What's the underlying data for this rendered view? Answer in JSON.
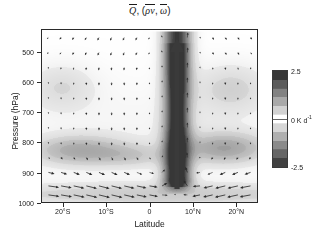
{
  "figure": {
    "title_parts": {
      "q": "Q",
      "comma": ", (",
      "rho_v": "ρv",
      "sep": ", ",
      "omega": "ω",
      "close": ")"
    },
    "title_plain": "Q̅, (ρv̅, ω̅)"
  },
  "axes": {
    "x": {
      "label": "Latitude",
      "ticks": [
        "20°S",
        "10°S",
        "0",
        "10°N",
        "20°N"
      ],
      "tick_values": [
        -20,
        -10,
        0,
        10,
        20
      ],
      "range": [
        -25,
        25
      ]
    },
    "y": {
      "label": "Pressure (hPa)",
      "ticks": [
        "500",
        "600",
        "700",
        "800",
        "900",
        "1000"
      ],
      "tick_values": [
        500,
        600,
        700,
        800,
        900,
        1000
      ],
      "range": [
        1000,
        425
      ],
      "inverted": true
    }
  },
  "colorbar": {
    "max_label": "2.5",
    "mid_label": "0",
    "unit_label": "K d",
    "unit_exp": "-1",
    "min_label": "-2.5",
    "max_value": 2.5,
    "mid_value": 0,
    "min_value": -2.5,
    "colormap": "grayscale-diverging",
    "color_high": "#5a5a5a",
    "color_mid": "#ffffff",
    "color_low": "#6a6a6a",
    "levels": [
      -2.5,
      -2.0,
      -1.5,
      -1.0,
      -0.5,
      0,
      0.5,
      1.0,
      1.5,
      2.0,
      2.5
    ]
  },
  "chart_data": {
    "type": "heatmap",
    "xlabel": "Latitude",
    "ylabel": "Pressure (hPa)",
    "xlim": [
      -25,
      25
    ],
    "ylim": [
      1000,
      425
    ],
    "grid": false,
    "legend": "colorbar-right",
    "cbar_label": "K d-1",
    "cbar_range": [
      -2.5,
      2.5
    ],
    "x": [
      -25,
      -22,
      -19,
      -16,
      -13,
      -10,
      -7,
      -4,
      -1,
      2,
      5,
      8,
      11,
      14,
      17,
      20,
      23,
      25
    ],
    "y": [
      425,
      500,
      550,
      600,
      650,
      700,
      750,
      800,
      850,
      900,
      950,
      1000
    ],
    "features": [
      {
        "name": "itcz-deep-heating-column",
        "center_lat": 6.5,
        "lat_extent": [
          4,
          9
        ],
        "pressure_extent": [
          425,
          960
        ],
        "peak_value": 2.5,
        "note": "Strong deep convective heating column at ITCZ, dark shading full depth"
      },
      {
        "name": "shallow-trade-cumulus-band-south",
        "center_lat": -17,
        "lat_extent": [
          -25,
          -5
        ],
        "pressure_extent": [
          780,
          880
        ],
        "peak_value": 0.9,
        "note": "Diffuse shallow heating band near 800-850 hPa in southern trades"
      },
      {
        "name": "shallow-trade-cumulus-band-north",
        "center_lat": 17,
        "lat_extent": [
          11,
          25
        ],
        "pressure_extent": [
          760,
          880
        ],
        "peak_value": 1.0,
        "note": "Diffuse shallow heating band near 800-850 hPa in northern trades"
      },
      {
        "name": "boundary-layer-heating",
        "center_lat": 0,
        "lat_extent": [
          -25,
          25
        ],
        "pressure_extent": [
          930,
          1000
        ],
        "peak_value": 0.7,
        "note": "Weak near-surface heating layer spanning full domain"
      },
      {
        "name": "mid-level-weak-heating-north",
        "center_lat": 18,
        "lat_extent": [
          12,
          25
        ],
        "pressure_extent": [
          560,
          680
        ],
        "peak_value": 0.5,
        "note": "Faint mid-tropospheric shading on north flank"
      },
      {
        "name": "mid-level-weak-heating-south",
        "center_lat": -21,
        "lat_extent": [
          -25,
          -14
        ],
        "pressure_extent": [
          560,
          680
        ],
        "peak_value": 0.45,
        "note": "Faint mid-tropospheric shading on south flank"
      }
    ],
    "vector_field": {
      "name": "mean-meridional-circulation",
      "components": [
        "rho*v (meridional mass flux)",
        "omega (vertical velocity)"
      ],
      "grid_nx": 17,
      "grid_ny": 12,
      "notes": [
        "Strong upward branch at 5-8N spanning full troposphere (large bold arrow).",
        "Low-level convergence toward ITCZ: northward flow south of 5N, southward flow north of 9N near 950-1000 hPa.",
        "Broad weak subsidence (downward arrows) over subtropics on both flanks.",
        "Strongest horizontal vectors are in the 930-1000 hPa boundary layer."
      ]
    }
  }
}
